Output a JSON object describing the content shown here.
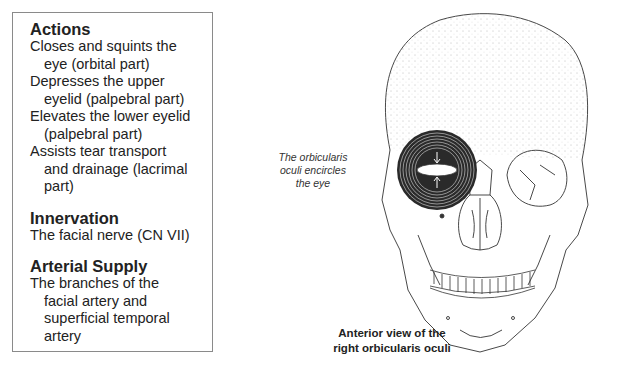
{
  "infobox": {
    "sections": [
      {
        "title": "Actions",
        "lines": [
          {
            "text": "Closes and squints the",
            "indent": false
          },
          {
            "text": "eye (orbital part)",
            "indent": true
          },
          {
            "text": "Depresses the upper",
            "indent": false
          },
          {
            "text": "eyelid (palpebral part)",
            "indent": true
          },
          {
            "text": "Elevates the lower eyelid",
            "indent": false
          },
          {
            "text": "(palpebral part)",
            "indent": true
          },
          {
            "text": "Assists tear transport",
            "indent": false
          },
          {
            "text": "and drainage (lacrimal",
            "indent": true
          },
          {
            "text": "part)",
            "indent": true
          }
        ]
      },
      {
        "title": "Innervation",
        "lines": [
          {
            "text": "The facial nerve (CN VII)",
            "indent": false
          }
        ]
      },
      {
        "title": "Arterial Supply",
        "lines": [
          {
            "text": "The branches of the",
            "indent": false
          },
          {
            "text": "facial artery and",
            "indent": true
          },
          {
            "text": "superficial temporal",
            "indent": true
          },
          {
            "text": "artery",
            "indent": true
          }
        ]
      }
    ]
  },
  "figure": {
    "annotation": [
      "The orbicularis",
      "oculi encircles",
      "the eye"
    ],
    "caption": [
      "Anterior view of the",
      "right orbicularis oculi"
    ],
    "colors": {
      "line": "#333333",
      "muscle": "#2a2a2a",
      "background": "#ffffff"
    }
  }
}
